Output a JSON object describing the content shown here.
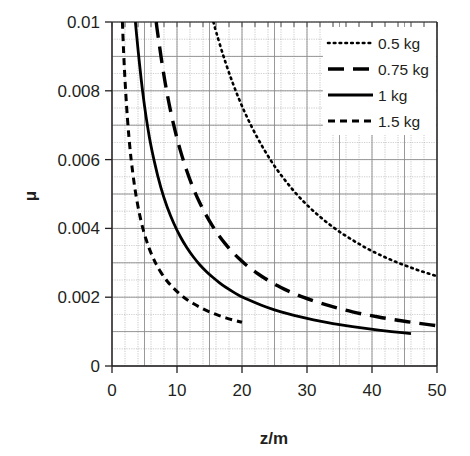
{
  "chart_data": {
    "type": "line",
    "title": "",
    "xlabel": "z/m",
    "ylabel": "μ",
    "xlim": [
      0,
      50
    ],
    "ylim": [
      0,
      0.01
    ],
    "xticks": [
      "0",
      "10",
      "20",
      "30",
      "40",
      "50"
    ],
    "xtick_values": [
      0,
      10,
      20,
      30,
      40,
      50
    ],
    "yticks": [
      "0",
      "0.002",
      "0.004",
      "0.006",
      "0.008",
      "0.01"
    ],
    "ytick_values": [
      0,
      0.002,
      0.004,
      0.006,
      0.008,
      0.01
    ],
    "grid": true,
    "grid_minor_x_step": 2,
    "grid_minor_y_step": 0.0005,
    "legend_position": "top-right",
    "axis_color": "#231f20",
    "grid_color": "#9a9a9a",
    "curve_color": "#000000",
    "background": "#ffffff",
    "series": [
      {
        "name": "0.5 kg",
        "style": "dotted",
        "x": [
          15.6,
          16,
          17,
          18,
          19,
          20,
          21,
          22,
          23,
          24,
          25,
          26,
          27,
          28,
          29,
          30,
          31,
          32,
          33,
          34,
          35,
          36,
          37,
          38,
          39,
          40,
          41,
          42,
          43,
          44,
          45,
          46,
          47,
          48,
          49,
          50
        ],
        "y": [
          0.01,
          0.00972,
          0.00909,
          0.00852,
          0.00801,
          0.00755,
          0.00714,
          0.00676,
          0.00642,
          0.0061,
          0.00581,
          0.00555,
          0.00531,
          0.00508,
          0.00487,
          0.00468,
          0.0045,
          0.00434,
          0.00418,
          0.00404,
          0.0039,
          0.00378,
          0.00366,
          0.00355,
          0.00344,
          0.00334,
          0.00325,
          0.00316,
          0.00308,
          0.003,
          0.00293,
          0.00286,
          0.00279,
          0.00273,
          0.00267,
          0.00261
        ]
      },
      {
        "name": "0.75 kg",
        "style": "long-dash",
        "x": [
          6.8,
          7,
          8,
          9,
          10,
          11,
          12,
          13,
          14,
          15,
          16,
          17,
          18,
          19,
          20,
          21,
          22,
          23,
          24,
          25,
          26,
          27,
          28,
          29,
          30,
          32,
          34,
          36,
          38,
          40,
          42,
          44,
          46,
          48,
          50
        ],
        "y": [
          0.01,
          0.0097,
          0.0084,
          0.0074,
          0.0066,
          0.00595,
          0.0054,
          0.00494,
          0.00455,
          0.00421,
          0.00391,
          0.00365,
          0.00342,
          0.00322,
          0.00304,
          0.00288,
          0.00274,
          0.00261,
          0.00249,
          0.00238,
          0.00228,
          0.00219,
          0.00211,
          0.00203,
          0.00196,
          0.00183,
          0.00172,
          0.00162,
          0.00153,
          0.00146,
          0.00139,
          0.00133,
          0.00127,
          0.00122,
          0.00117
        ]
      },
      {
        "name": "1 kg",
        "style": "solid",
        "x": [
          3.6,
          4,
          4.5,
          5,
          5.5,
          6,
          7,
          8,
          9,
          10,
          11,
          12,
          13,
          14,
          15,
          16,
          17,
          18,
          19,
          20,
          22,
          24,
          26,
          28,
          30,
          32,
          34,
          36,
          38,
          40,
          42,
          44,
          46
        ],
        "y": [
          0.01,
          0.0092,
          0.0083,
          0.00755,
          0.00692,
          0.00638,
          0.00553,
          0.00487,
          0.00436,
          0.00394,
          0.00359,
          0.0033,
          0.00305,
          0.00284,
          0.00266,
          0.0025,
          0.00235,
          0.00223,
          0.00211,
          0.00201,
          0.00184,
          0.00169,
          0.00157,
          0.00147,
          0.00138,
          0.0013,
          0.00123,
          0.00117,
          0.00112,
          0.00107,
          0.00102,
          0.00098,
          0.00094
        ]
      },
      {
        "name": "1.5 kg",
        "style": "short-dash",
        "x": [
          1.6,
          1.8,
          2,
          2.25,
          2.5,
          2.75,
          3,
          3.5,
          4,
          4.5,
          5,
          5.5,
          6,
          6.5,
          7,
          8,
          9,
          10,
          11,
          12,
          13,
          14,
          15,
          16,
          17,
          18,
          19,
          20
        ],
        "y": [
          0.01,
          0.00905,
          0.0083,
          0.00752,
          0.00688,
          0.00635,
          0.0059,
          0.00517,
          0.00462,
          0.00418,
          0.00382,
          0.00353,
          0.00328,
          0.00307,
          0.00288,
          0.00258,
          0.00235,
          0.00216,
          0.002,
          0.00187,
          0.00176,
          0.00166,
          0.00157,
          0.0015,
          0.00143,
          0.00137,
          0.00132,
          0.00127
        ]
      }
    ]
  },
  "legend": {
    "items": [
      {
        "label": "0.5 kg",
        "style": "dotted"
      },
      {
        "label": "0.75 kg",
        "style": "long-dash"
      },
      {
        "label": "1 kg",
        "style": "solid"
      },
      {
        "label": "1.5 kg",
        "style": "short-dash"
      }
    ]
  }
}
